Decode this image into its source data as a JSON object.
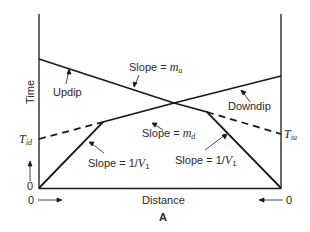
{
  "figure": {
    "panel_label": "A",
    "axes": {
      "y_label": "Time",
      "x_label": "Distance",
      "left_origin_y": "0",
      "left_origin_x": "0",
      "right_origin_x": "0"
    },
    "annotations": {
      "updip": "Updip",
      "downdip": "Downdip",
      "slope_mu_prefix": "Slope =",
      "slope_mu_var": "m",
      "slope_mu_sub": "u",
      "slope_md_prefix": "Slope =",
      "slope_md_var": "m",
      "slope_md_sub": "d",
      "slope_v1_left_prefix": "Slope = 1/",
      "slope_v1_left_var": "V",
      "slope_v1_left_sub": "1",
      "slope_v1_right_prefix": "Slope = 1/",
      "slope_v1_right_var": "V",
      "slope_v1_right_sub": "1",
      "tid_var": "T",
      "tid_sub": "id",
      "tiu_var": "T",
      "tiu_sub": "iu"
    },
    "colors": {
      "line": "#1a1a1a",
      "background": "#ffffff"
    }
  }
}
